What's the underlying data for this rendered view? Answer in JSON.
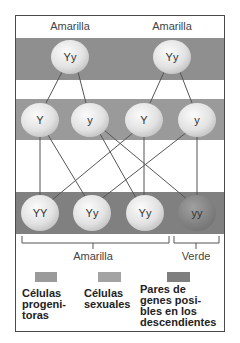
{
  "diagram": {
    "colors": {
      "band_parent": "#8f8f8f",
      "band_gamete": "#9a9a9a",
      "band_offspring": "#808080",
      "node_light": "#ebebeb",
      "node_dark": "#8a8a8a",
      "line": "#555555"
    },
    "parents": {
      "labels": [
        "Amarilla",
        "Amarilla"
      ],
      "nodes": [
        "Yy",
        "Yy"
      ]
    },
    "gametes": {
      "nodes": [
        "Y",
        "y",
        "Y",
        "y"
      ]
    },
    "offspring": {
      "nodes": [
        "YY",
        "Yy",
        "Yy",
        "yy"
      ],
      "groups": [
        {
          "label": "Amarilla",
          "members": [
            "YY",
            "Yy",
            "Yy"
          ]
        },
        {
          "label": "Verde",
          "members": [
            "yy"
          ]
        }
      ]
    },
    "legend": [
      {
        "swatch": "#9a9a9a",
        "text_lines": [
          "Células",
          "progeni-",
          "toras"
        ]
      },
      {
        "swatch": "#a3a3a3",
        "text_lines": [
          "Células",
          "sexuales"
        ]
      },
      {
        "swatch": "#7e7e7e",
        "text_lines": [
          "Pares de",
          "genes posi-",
          "bles en los",
          "descendientes"
        ]
      }
    ]
  }
}
